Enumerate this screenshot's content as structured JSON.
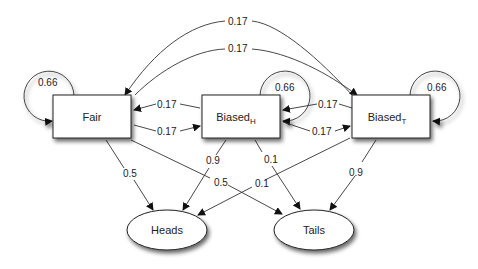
{
  "diagram": {
    "type": "hidden-markov-model",
    "states": [
      {
        "id": "fair",
        "label": "Fair",
        "sub": ""
      },
      {
        "id": "biased_h",
        "label": "Biased",
        "sub": "H"
      },
      {
        "id": "biased_t",
        "label": "Biased",
        "sub": "T"
      }
    ],
    "emissions": [
      {
        "id": "heads",
        "label": "Heads"
      },
      {
        "id": "tails",
        "label": "Tails"
      }
    ],
    "self_loops": {
      "fair": "0.66",
      "biased_h": "0.66",
      "biased_t": "0.66"
    },
    "transitions": {
      "biased_t_to_fair_top": "0.17",
      "fair_to_biased_t_arc": "0.17",
      "biased_h_to_fair": "0.17",
      "fair_to_biased_h": "0.17",
      "biased_t_to_biased_h": "0.17",
      "biased_h_to_biased_t": "0.17"
    },
    "emission_probs": {
      "fair_heads": "0.5",
      "fair_tails": "0.5",
      "biased_h_heads": "0.9",
      "biased_h_tails": "0.1",
      "biased_t_heads": "0.1",
      "biased_t_tails": "0.9"
    }
  }
}
